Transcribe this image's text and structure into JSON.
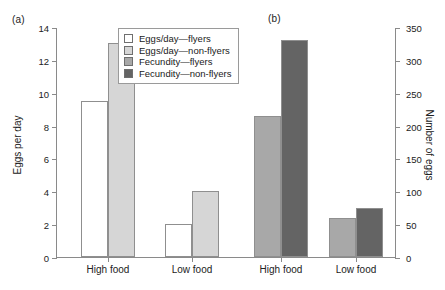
{
  "chart_data": {
    "type": "bar",
    "title": "",
    "panels": [
      {
        "tag": "(a)",
        "axis": "left",
        "ylabel": "Eggs per day",
        "ylim": [
          0,
          14
        ],
        "yticks": [
          0,
          2,
          4,
          6,
          8,
          10,
          12,
          14
        ],
        "categories": [
          "High food",
          "Low food"
        ],
        "series": [
          {
            "name": "Eggs/day—flyers",
            "color": "#ffffff",
            "values": [
              9.5,
              2.0
            ]
          },
          {
            "name": "Eggs/day—non-flyers",
            "color": "#d6d6d6",
            "values": [
              13.0,
              4.0
            ]
          }
        ]
      },
      {
        "tag": "(b)",
        "axis": "right",
        "ylabel": "Number of eggs",
        "ylim": [
          0,
          350
        ],
        "yticks": [
          0,
          50,
          100,
          150,
          200,
          250,
          300,
          350
        ],
        "categories": [
          "High food",
          "Low food"
        ],
        "series": [
          {
            "name": "Fecundity—flyers",
            "color": "#a8a8a8",
            "values": [
              215,
              60
            ]
          },
          {
            "name": "Fecundity—non-flyers",
            "color": "#646464",
            "values": [
              330,
              75
            ]
          }
        ]
      }
    ],
    "legend": {
      "position": "top-center",
      "entries": [
        {
          "label": "Eggs/day—flyers",
          "color": "#ffffff"
        },
        {
          "label": "Eggs/day—non-flyers",
          "color": "#d6d6d6"
        },
        {
          "label": "Fecundity—flyers",
          "color": "#a8a8a8"
        },
        {
          "label": "Fecundity—non-flyers",
          "color": "#646464"
        }
      ]
    },
    "grid": false
  }
}
